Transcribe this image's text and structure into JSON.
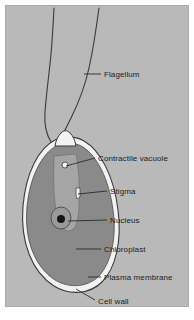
{
  "figure": {
    "panel_background": "#b9b9b9",
    "page_background": "#ffffff"
  },
  "colors": {
    "background": "#b9b9b9",
    "chloroplast": "#8a8a8a",
    "cytoplasm": "#a5a5a5",
    "cell_wall": "#f2f2f2",
    "outline": "#3a3a3a",
    "nucleus_fill": "#9a9a9a",
    "nucleolus": "#141414",
    "vacuole": "#f4f4f4",
    "stigma": "#efefef",
    "label_text": "#1c1c1c",
    "leader_line": "#2a2a2a"
  },
  "labels": [
    {
      "id": "flagellum",
      "text": "Flagellum",
      "text_x": 98,
      "text_y": 64,
      "leader_x1": 78,
      "leader_y1": 68,
      "leader_x2": 95,
      "leader_y2": 68
    },
    {
      "id": "contractile-vacuole",
      "text": "Contractile vacuole",
      "text_x": 92,
      "text_y": 148,
      "leader_x1": 60,
      "leader_y1": 160,
      "leader_x2": 89,
      "leader_y2": 152
    },
    {
      "id": "stigma",
      "text": "Stigma",
      "text_x": 104,
      "text_y": 181,
      "leader_x1": 72,
      "leader_y1": 188,
      "leader_x2": 101,
      "leader_y2": 185
    },
    {
      "id": "nucleus",
      "text": "Nucleus",
      "text_x": 104,
      "text_y": 210,
      "leader_x1": 62,
      "leader_y1": 215,
      "leader_x2": 101,
      "leader_y2": 214
    },
    {
      "id": "chloroplast",
      "text": "Chloroplast",
      "text_x": 98,
      "text_y": 239,
      "leader_x1": 70,
      "leader_y1": 243,
      "leader_x2": 95,
      "leader_y2": 243
    },
    {
      "id": "plasma-membrane",
      "text": "Plasma membrane",
      "text_x": 98,
      "text_y": 267,
      "leader_x1": 82,
      "leader_y1": 271,
      "leader_x2": 95,
      "leader_y2": 271
    },
    {
      "id": "cell-wall",
      "text": "Cell wall",
      "text_x": 92,
      "text_y": 291,
      "leader_x1": 70,
      "leader_y1": 283,
      "leader_x2": 89,
      "leader_y2": 294
    }
  ],
  "structures": {
    "flagellum_left_path": "M 48 2 C 47 22, 46 40, 44 58 C 42 76, 40 92, 39 106 C 38 120, 40 128, 45 136",
    "flagellum_right_path": "M 93 2 C 90 24, 87 44, 83 62 C 79 80, 73 96, 65 112 C 60 122, 56 130, 53 136",
    "cell_wall_path": "M 49 134 C 33 142, 20 166, 17 200 C 14 236, 26 266, 48 280 C 64 290, 84 288, 96 276 C 110 262, 116 234, 112 204 C 108 170, 94 144, 78 135 C 70 130, 57 130, 49 134 Z",
    "plasma_membrane_path": "M 50 140 C 36 148, 24 170, 21 201 C 18 234, 29 261, 49 274 C 64 283, 82 281, 93 270 C 105 257, 111 232, 107 204 C 103 173, 91 150, 77 141 C 69 136, 58 136, 50 140 Z",
    "papilla_path": "M 49 140 C 50 134, 52 130, 55 127 C 58 124, 61 124, 64 127 C 67 130, 69 134, 70 140 Z",
    "cytoplasm_path": "M 48 150 C 47 178, 48 200, 52 214 C 56 226, 64 228, 69 221 C 73 214, 74 196, 73 172 C 72 160, 71 152, 70 148 Z",
    "nucleus_cx": 55,
    "nucleus_cy": 212,
    "nucleus_rx": 10,
    "nucleus_ry": 11,
    "nucleolus_cx": 55,
    "nucleolus_cy": 213,
    "nucleolus_r": 4,
    "vacuole_cx": 59,
    "vacuole_cy": 159,
    "vacuole_r": 3,
    "stigma_path": "M 70 182 L 74 182 L 74 191 L 71 193 L 70 189 Z"
  }
}
